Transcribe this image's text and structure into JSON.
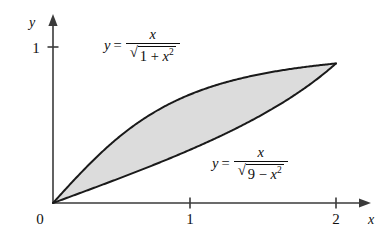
{
  "figure": {
    "type": "math-graph",
    "background_color": "#ffffff",
    "shade_color": "#dcdcdc",
    "curve_color": "#1a1a1a",
    "axis_color": "#3a3a3a"
  },
  "axes": {
    "x_axis_label": "x",
    "y_axis_label": "y",
    "origin_label": "0",
    "x_ticks": [
      {
        "value": 1,
        "label": "1"
      },
      {
        "value": 2,
        "label": "2"
      }
    ],
    "y_ticks": [
      {
        "value": 1,
        "label": "1"
      }
    ],
    "x_range": [
      0,
      2.2
    ],
    "y_range": [
      0,
      1.12
    ]
  },
  "curves": [
    {
      "id": "upper",
      "label_text": "y = x / sqrt(1 + x^2)",
      "lead": "y",
      "equals": "=",
      "numerator": "x",
      "radicand_prefix": "1 + ",
      "radicand_var": "x",
      "radicand_exp": "2",
      "radical_sign": "√"
    },
    {
      "id": "lower",
      "label_text": "y = x / sqrt(9 - x^2)",
      "lead": "y",
      "equals": "=",
      "numerator": "x",
      "radicand_prefix": "9 − ",
      "radicand_var": "x",
      "radicand_exp": "2",
      "radical_sign": "√"
    }
  ],
  "chart_data": {
    "type": "line",
    "title": "",
    "xlabel": "x",
    "ylabel": "y",
    "xlim": [
      0,
      2.2
    ],
    "ylim": [
      0,
      1.12
    ],
    "grid": false,
    "legend": "inline-annotations",
    "shaded_between": [
      "y = x/sqrt(1+x^2)",
      "y = x/sqrt(9-x^2)"
    ],
    "intersections": [
      [
        0,
        0
      ],
      [
        2,
        0.894
      ]
    ],
    "series": [
      {
        "name": "y = x/sqrt(1+x^2)",
        "x": [
          0,
          0.2,
          0.4,
          0.6,
          0.8,
          1.0,
          1.2,
          1.4,
          1.6,
          1.8,
          2.0
        ],
        "values": [
          0,
          0.196,
          0.371,
          0.514,
          0.625,
          0.707,
          0.768,
          0.814,
          0.848,
          0.874,
          0.894
        ]
      },
      {
        "name": "y = x/sqrt(9-x^2)",
        "x": [
          0,
          0.2,
          0.4,
          0.6,
          0.8,
          1.0,
          1.2,
          1.4,
          1.6,
          1.8,
          2.0
        ],
        "values": [
          0,
          0.067,
          0.134,
          0.203,
          0.274,
          0.354,
          0.431,
          0.521,
          0.623,
          0.746,
          0.894
        ]
      }
    ]
  }
}
